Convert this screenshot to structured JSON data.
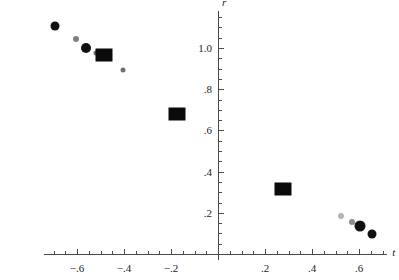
{
  "chart_data": {
    "type": "scatter",
    "title": "",
    "subtitle": "",
    "xlabel": "t",
    "ylabel": "r",
    "xlim": [
      -0.74,
      0.72
    ],
    "ylim": [
      -0.03,
      1.18
    ],
    "grid": false,
    "legend": null,
    "xticks": [
      -0.6,
      -0.4,
      -0.2,
      0.2,
      0.4,
      0.6
    ],
    "xtick_labels": [
      "−.6",
      "−.4",
      "−.2",
      ".2",
      ".4",
      ".6"
    ],
    "xminor_step": 0.05,
    "yticks": [
      0.2,
      0.4,
      0.6,
      0.8,
      1.0
    ],
    "ytick_labels": [
      ".2",
      ".4",
      ".6",
      ".8",
      "1.0"
    ],
    "yminor_step": 0.05,
    "axis_color": "#4a4a4a",
    "series": [
      {
        "name": "markers",
        "points": [
          {
            "x": -0.695,
            "y": 1.105,
            "marker": "circle",
            "size": 9,
            "color": "#111111"
          },
          {
            "x": -0.605,
            "y": 1.045,
            "marker": "circle",
            "size": 6,
            "color": "#808080"
          },
          {
            "x": -0.56,
            "y": 1.0,
            "marker": "circle",
            "size": 10,
            "color": "#111111"
          },
          {
            "x": -0.52,
            "y": 0.975,
            "marker": "circle",
            "size": 5,
            "color": "#6e6e6e"
          },
          {
            "x": -0.485,
            "y": 0.965,
            "marker": "square",
            "size": 17,
            "color": "#0a0a0a"
          },
          {
            "x": -0.405,
            "y": 0.895,
            "marker": "circle",
            "size": 5,
            "color": "#707070"
          },
          {
            "x": -0.175,
            "y": 0.68,
            "marker": "square",
            "size": 17,
            "color": "#0a0a0a"
          },
          {
            "x": 0.275,
            "y": 0.315,
            "marker": "square",
            "size": 17,
            "color": "#0a0a0a"
          },
          {
            "x": 0.525,
            "y": 0.185,
            "marker": "circle",
            "size": 6,
            "color": "#b4b4b4"
          },
          {
            "x": 0.57,
            "y": 0.155,
            "marker": "circle",
            "size": 6,
            "color": "#8c8c8c"
          },
          {
            "x": 0.605,
            "y": 0.135,
            "marker": "circle",
            "size": 11,
            "color": "#111111"
          },
          {
            "x": 0.655,
            "y": 0.095,
            "marker": "circle",
            "size": 9,
            "color": "#111111"
          }
        ]
      }
    ]
  }
}
